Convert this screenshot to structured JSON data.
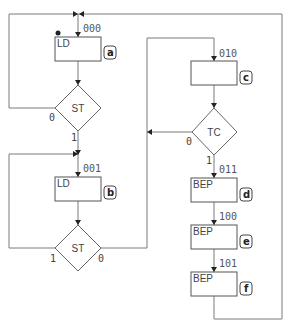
{
  "diagram": {
    "type": "ASM chart / state flowchart",
    "states": [
      {
        "id": "a",
        "code": "000",
        "output": "LD",
        "initial": true
      },
      {
        "id": "b",
        "code": "001",
        "output": "LD"
      },
      {
        "id": "c",
        "code": "010",
        "output": ""
      },
      {
        "id": "d",
        "code": "011",
        "output": "BEP"
      },
      {
        "id": "e",
        "code": "100",
        "output": "BEP"
      },
      {
        "id": "f",
        "code": "101",
        "output": "BEP"
      }
    ],
    "decisions": [
      {
        "id": "st1",
        "condition": "ST",
        "false_label": "0",
        "true_label": "1",
        "false_target": "a",
        "true_target": "b"
      },
      {
        "id": "st2",
        "condition": "ST",
        "false_label": "0",
        "true_label": "1",
        "false_target": "c",
        "true_target": "b"
      },
      {
        "id": "tc",
        "condition": "TC",
        "false_label": "0",
        "true_label": "1",
        "false_target": "c",
        "true_target": "d"
      }
    ],
    "colors": {
      "line": "#7a7a7a",
      "box": "#555555",
      "text": "#444444",
      "background": "#ffffff"
    }
  }
}
